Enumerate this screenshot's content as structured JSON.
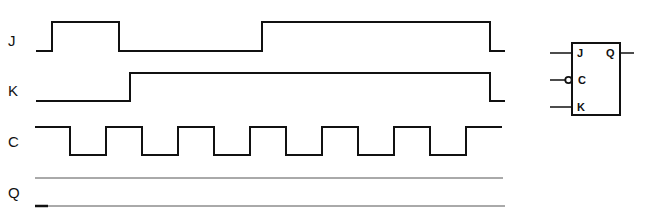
{
  "diagram": {
    "signals": [
      {
        "name": "J",
        "label": "J"
      },
      {
        "name": "K",
        "label": "K"
      },
      {
        "name": "C",
        "label": "C"
      },
      {
        "name": "Q",
        "label": "Q"
      }
    ],
    "flip_flop": {
      "inputs": [
        "J",
        "C",
        "K"
      ],
      "output": "Q",
      "clock_inverted": true
    }
  }
}
